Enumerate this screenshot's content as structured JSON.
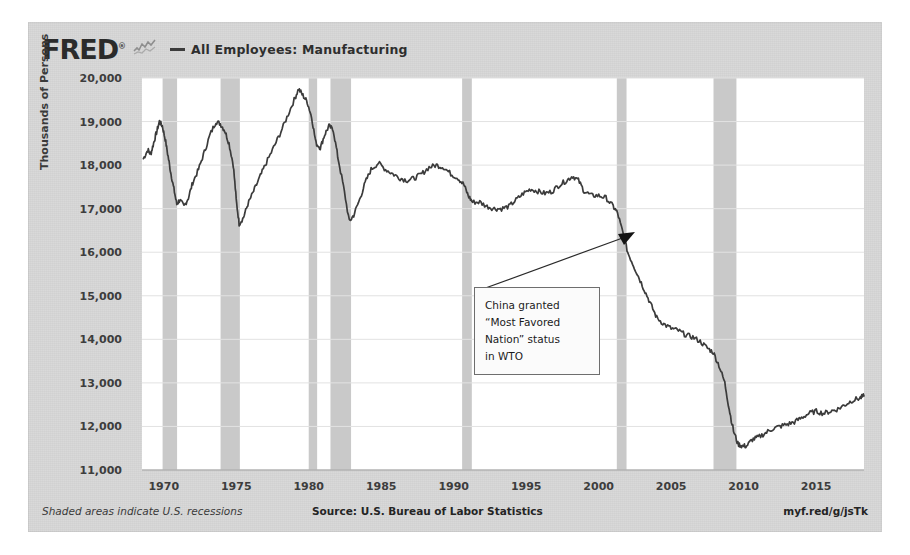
{
  "header": {
    "logo_text": "FRED",
    "logo_registered": "®",
    "logo_mark_icon": "mini-line-chart-icon",
    "legend_dash": "—",
    "legend_label": "All Employees: Manufacturing"
  },
  "annotation": {
    "lines": [
      "China granted",
      "“Most Favored",
      "Nation” status",
      "in WTO"
    ],
    "pointer_icon": "arrow-pointer-icon"
  },
  "footer": {
    "recession_note": "Shaded areas indicate U.S. recessions",
    "source": "Source: U.S. Bureau of Labor Statistics",
    "permalink": "myf.red/g/jsTk"
  },
  "chart_data": {
    "type": "line",
    "title": "All Employees: Manufacturing",
    "xlabel": "",
    "ylabel": "Thousands of Persons",
    "ylim": [
      11000,
      20000
    ],
    "xlim": [
      1968.5,
      2018.3
    ],
    "yticks": [
      20000,
      19000,
      18000,
      17000,
      16000,
      15000,
      14000,
      13000,
      12000,
      11000
    ],
    "ytick_labels": [
      "20,000",
      "19,000",
      "18,000",
      "17,000",
      "16,000",
      "15,000",
      "14,000",
      "13,000",
      "12,000",
      "11,000"
    ],
    "xticks": [
      1970,
      1975,
      1980,
      1985,
      1990,
      1995,
      2000,
      2005,
      2010,
      2015
    ],
    "xtick_labels": [
      "1970",
      "1975",
      "1980",
      "1985",
      "1990",
      "1995",
      "2000",
      "2005",
      "2010",
      "2015"
    ],
    "grid": true,
    "legend_position": "top-left",
    "line_color": "#3b3b3b",
    "recession_band_color": "#c9c9c9",
    "plot_background": "#ffffff",
    "page_background": "#d9d9d9",
    "recessions": [
      {
        "start": 1969.92,
        "end": 1970.92
      },
      {
        "start": 1973.92,
        "end": 1975.25
      },
      {
        "start": 1980.0,
        "end": 1980.58
      },
      {
        "start": 1981.5,
        "end": 1982.92
      },
      {
        "start": 1990.58,
        "end": 1991.25
      },
      {
        "start": 2001.25,
        "end": 2001.92
      },
      {
        "start": 2007.92,
        "end": 2009.5
      }
    ],
    "annotations": [
      {
        "text": "China granted “Most Favored Nation” status in WTO",
        "point_x": 2001.3,
        "point_y": 16900
      }
    ],
    "series": [
      {
        "name": "All Employees: Manufacturing",
        "units": "Thousands of Persons",
        "x": [
          1968.6,
          1968.9,
          1969.1,
          1969.3,
          1969.5,
          1969.7,
          1969.9,
          1970.1,
          1970.3,
          1970.5,
          1970.7,
          1970.9,
          1971.1,
          1971.4,
          1971.7,
          1972.0,
          1972.4,
          1972.8,
          1973.2,
          1973.6,
          1973.9,
          1974.2,
          1974.5,
          1974.8,
          1975.0,
          1975.2,
          1975.5,
          1975.8,
          1976.2,
          1976.6,
          1977.0,
          1977.5,
          1978.0,
          1978.5,
          1979.0,
          1979.3,
          1979.6,
          1979.9,
          1980.2,
          1980.5,
          1980.8,
          1981.1,
          1981.4,
          1981.7,
          1982.0,
          1982.4,
          1982.8,
          1983.1,
          1983.5,
          1983.9,
          1984.3,
          1984.8,
          1985.3,
          1985.8,
          1986.3,
          1986.8,
          1987.3,
          1987.8,
          1988.3,
          1988.8,
          1989.3,
          1989.8,
          1990.3,
          1990.7,
          1991.0,
          1991.3,
          1991.8,
          1992.3,
          1992.8,
          1993.3,
          1993.8,
          1994.3,
          1994.8,
          1995.3,
          1995.8,
          1996.3,
          1996.8,
          1997.3,
          1997.8,
          1998.2,
          1998.6,
          1999.0,
          1999.5,
          2000.0,
          2000.5,
          2001.0,
          2001.3,
          2001.7,
          2002.0,
          2002.4,
          2002.8,
          2003.2,
          2003.6,
          2004.0,
          2004.5,
          2005.0,
          2005.5,
          2006.0,
          2006.5,
          2007.0,
          2007.5,
          2007.9,
          2008.3,
          2008.7,
          2009.0,
          2009.3,
          2009.6,
          2009.9,
          2010.2,
          2010.6,
          2011.0,
          2011.5,
          2012.0,
          2012.5,
          2013.0,
          2013.5,
          2014.0,
          2014.5,
          2015.0,
          2015.5,
          2016.0,
          2016.5,
          2017.0,
          2017.5,
          2018.0,
          2018.3
        ],
        "y": [
          18150,
          18350,
          18250,
          18500,
          18750,
          19000,
          18900,
          18600,
          18200,
          17800,
          17450,
          17100,
          17200,
          17050,
          17250,
          17600,
          17900,
          18300,
          18700,
          19000,
          18950,
          18800,
          18500,
          18000,
          17200,
          16650,
          16800,
          17100,
          17400,
          17700,
          18000,
          18350,
          18700,
          19100,
          19500,
          19750,
          19600,
          19450,
          19100,
          18500,
          18400,
          18700,
          18900,
          18800,
          18200,
          17500,
          16700,
          16850,
          17200,
          17600,
          17900,
          18050,
          17900,
          17800,
          17700,
          17650,
          17700,
          17800,
          17950,
          18000,
          17950,
          17800,
          17700,
          17550,
          17300,
          17150,
          17150,
          17050,
          17000,
          17000,
          17050,
          17200,
          17350,
          17450,
          17400,
          17350,
          17400,
          17550,
          17650,
          17750,
          17650,
          17400,
          17300,
          17300,
          17250,
          17050,
          16900,
          16400,
          16000,
          15700,
          15400,
          15100,
          14800,
          14500,
          14350,
          14250,
          14200,
          14100,
          14050,
          13950,
          13800,
          13700,
          13400,
          13000,
          12400,
          11900,
          11600,
          11550,
          11550,
          11700,
          11750,
          11850,
          11950,
          12000,
          12050,
          12100,
          12200,
          12300,
          12350,
          12300,
          12350,
          12400,
          12500,
          12600,
          12650,
          12700
        ]
      }
    ]
  }
}
